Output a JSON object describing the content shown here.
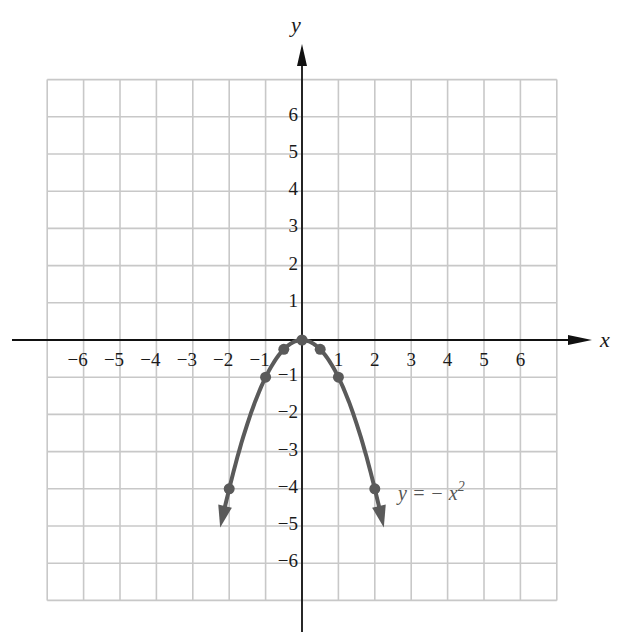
{
  "chart_data": {
    "type": "line",
    "title": "",
    "xlabel": "x",
    "ylabel": "y",
    "xlim": [
      -7,
      7
    ],
    "ylim": [
      -7,
      7
    ],
    "grid": true,
    "x_ticks": [
      "-6",
      "-5",
      "-4",
      "-3",
      "-2",
      "-1",
      "1",
      "2",
      "3",
      "4",
      "5",
      "6"
    ],
    "y_ticks": [
      "6",
      "5",
      "4",
      "3",
      "2",
      "1",
      "-1",
      "-2",
      "-3",
      "-4",
      "-5",
      "-6"
    ],
    "series": [
      {
        "name": "y = -x^2",
        "function": "-x^2",
        "domain": [
          -2.15,
          2.15
        ],
        "arrows_at_ends": true,
        "points": [
          {
            "x": -2,
            "y": -4
          },
          {
            "x": -1,
            "y": -1
          },
          {
            "x": -0.5,
            "y": -0.25
          },
          {
            "x": 0,
            "y": 0
          },
          {
            "x": 0.5,
            "y": -0.25
          },
          {
            "x": 1,
            "y": -1
          },
          {
            "x": 2,
            "y": -4
          }
        ],
        "color": "#5a5a5a"
      }
    ],
    "annotations": [
      {
        "text_prefix": "y = − x",
        "superscript": "2",
        "x": 2.6,
        "y": -4.1
      }
    ]
  },
  "labels": {
    "x_axis": "x",
    "y_axis": "y",
    "equation": "y =  −  x",
    "equation_exp": "2"
  },
  "colors": {
    "grid": "#c8c8c8",
    "axis": "#111111",
    "curve": "#5a5a5a"
  }
}
